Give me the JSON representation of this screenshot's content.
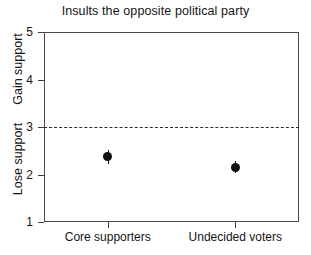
{
  "chart_data": {
    "type": "scatter",
    "title": "Insults the opposite political party",
    "xlabel": "",
    "ylabel": "",
    "categories": [
      "Core supporters",
      "Undecided voters"
    ],
    "values": [
      2.37,
      2.15
    ],
    "error_low": [
      2.22,
      2.03
    ],
    "error_high": [
      2.52,
      2.28
    ],
    "ylim": [
      1,
      5
    ],
    "yticks": [
      1,
      2,
      3,
      4,
      5
    ],
    "ytick_labels": [
      "1",
      "2",
      "3",
      "4",
      "5"
    ],
    "y_axis_upper_label": "Gain support",
    "y_axis_lower_label": "Lose support",
    "reference_line": 3,
    "reference_line_style": "dashed",
    "grid": false,
    "legend": "none",
    "point_color": "#111111",
    "frame_color": "#4a4a4a"
  },
  "axis": {
    "ticks": [
      {
        "label": "5",
        "value": 5
      },
      {
        "label": "4",
        "value": 4
      },
      {
        "label": "3",
        "value": 3
      },
      {
        "label": "2",
        "value": 2
      },
      {
        "label": "1",
        "value": 1
      }
    ]
  }
}
